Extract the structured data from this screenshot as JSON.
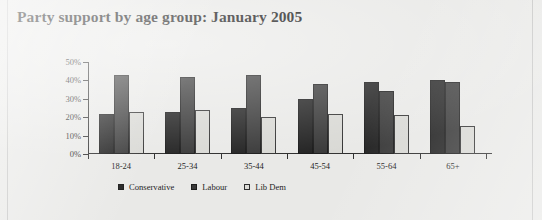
{
  "chart_data": {
    "type": "bar",
    "title": "Party support by age group: January 2005",
    "xlabel": "",
    "ylabel": "",
    "ylim": [
      0,
      50
    ],
    "ytick_labels": [
      "50%",
      "40%",
      "30%",
      "20%",
      "10%",
      "0%"
    ],
    "ytick_values": [
      50,
      40,
      30,
      20,
      10,
      0
    ],
    "grid": false,
    "legend_position": "bottom",
    "categories": [
      "18-24",
      "25-34",
      "35-44",
      "45-54",
      "55-64",
      "65+"
    ],
    "series": [
      {
        "name": "Conservative",
        "color": "#242424",
        "values": [
          22,
          23,
          25,
          30,
          39,
          40
        ]
      },
      {
        "name": "Labour",
        "color": "#3a3a3a",
        "values": [
          43,
          42,
          43,
          38,
          34,
          39
        ]
      },
      {
        "name": "Lib Dem",
        "color": "#d9d9d5",
        "values": [
          23,
          24,
          20,
          22,
          21,
          15
        ]
      }
    ]
  },
  "legend": {
    "items": [
      {
        "label": "Conservative",
        "key": "conservative"
      },
      {
        "label": "Labour",
        "key": "labour"
      },
      {
        "label": "Lib Dem",
        "key": "libdem"
      }
    ]
  }
}
